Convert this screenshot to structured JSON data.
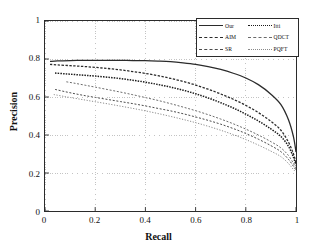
{
  "chart_data": {
    "type": "line",
    "title": "",
    "xlabel": "Recall",
    "ylabel": "Precision",
    "xlim": [
      0,
      1
    ],
    "ylim": [
      0,
      1
    ],
    "xticks": [
      "0",
      "0.2",
      "0.4",
      "0.6",
      "0.8",
      "1"
    ],
    "xtick_values": [
      0,
      0.2,
      0.4,
      0.6,
      0.8,
      1
    ],
    "yticks": [
      "0",
      "0.2",
      "0.4",
      "0.6",
      "0.8",
      "1"
    ],
    "ytick_values": [
      0,
      0.2,
      0.4,
      0.6,
      0.8,
      1
    ],
    "grid": true,
    "grid_style": "dotted",
    "legend_position": "upper right",
    "legend_columns": 2,
    "series": [
      {
        "name": "Our",
        "style": "solid",
        "color": "#2b2b2b",
        "width": 1.3,
        "x": [
          0.02,
          0.05,
          0.1,
          0.15,
          0.2,
          0.25,
          0.3,
          0.35,
          0.4,
          0.45,
          0.5,
          0.55,
          0.6,
          0.65,
          0.7,
          0.75,
          0.8,
          0.85,
          0.9,
          0.94,
          0.97,
          0.99,
          1.0
        ],
        "y": [
          0.787,
          0.79,
          0.792,
          0.793,
          0.793,
          0.793,
          0.793,
          0.792,
          0.791,
          0.789,
          0.786,
          0.78,
          0.772,
          0.76,
          0.745,
          0.725,
          0.7,
          0.665,
          0.615,
          0.56,
          0.48,
          0.39,
          0.31
        ]
      },
      {
        "name": "AIM",
        "style": "dashed",
        "color": "#2b2b2b",
        "width": 1.3,
        "x": [
          0.02,
          0.05,
          0.1,
          0.15,
          0.2,
          0.25,
          0.3,
          0.35,
          0.4,
          0.45,
          0.5,
          0.55,
          0.6,
          0.65,
          0.7,
          0.75,
          0.8,
          0.85,
          0.9,
          0.94,
          0.97,
          0.99,
          1.0
        ],
        "y": [
          0.772,
          0.769,
          0.765,
          0.761,
          0.756,
          0.75,
          0.743,
          0.734,
          0.724,
          0.712,
          0.698,
          0.682,
          0.663,
          0.641,
          0.616,
          0.588,
          0.556,
          0.518,
          0.472,
          0.425,
          0.362,
          0.3,
          0.252
        ]
      },
      {
        "name": "Itti",
        "style": "dotted-dense",
        "color": "#1a1a1a",
        "width": 1.5,
        "x": [
          0.04,
          0.08,
          0.12,
          0.16,
          0.2,
          0.25,
          0.3,
          0.35,
          0.4,
          0.45,
          0.5,
          0.55,
          0.6,
          0.65,
          0.7,
          0.75,
          0.8,
          0.85,
          0.9,
          0.94,
          0.97,
          0.99,
          1.0
        ],
        "y": [
          0.726,
          0.722,
          0.718,
          0.714,
          0.71,
          0.704,
          0.697,
          0.688,
          0.678,
          0.666,
          0.652,
          0.636,
          0.617,
          0.595,
          0.57,
          0.542,
          0.51,
          0.474,
          0.432,
          0.392,
          0.34,
          0.282,
          0.24
        ]
      },
      {
        "name": "QDCT",
        "style": "dashed-fine",
        "color": "#6a6a6a",
        "width": 1.0,
        "x": [
          0.085,
          0.12,
          0.16,
          0.2,
          0.25,
          0.3,
          0.35,
          0.4,
          0.45,
          0.5,
          0.55,
          0.6,
          0.65,
          0.7,
          0.75,
          0.8,
          0.85,
          0.9,
          0.94,
          0.97,
          0.99,
          1.0
        ],
        "y": [
          0.68,
          0.672,
          0.662,
          0.652,
          0.639,
          0.626,
          0.612,
          0.597,
          0.582,
          0.565,
          0.547,
          0.528,
          0.507,
          0.484,
          0.459,
          0.431,
          0.4,
          0.365,
          0.332,
          0.292,
          0.25,
          0.222
        ]
      },
      {
        "name": "SR",
        "style": "dashed-fine",
        "color": "#4a4a4a",
        "width": 1.0,
        "x": [
          0.04,
          0.08,
          0.12,
          0.16,
          0.2,
          0.25,
          0.3,
          0.35,
          0.4,
          0.45,
          0.5,
          0.55,
          0.6,
          0.65,
          0.7,
          0.75,
          0.8,
          0.85,
          0.9,
          0.94,
          0.97,
          0.99,
          1.0
        ],
        "y": [
          0.64,
          0.628,
          0.617,
          0.607,
          0.598,
          0.587,
          0.576,
          0.565,
          0.553,
          0.54,
          0.527,
          0.512,
          0.495,
          0.477,
          0.457,
          0.434,
          0.408,
          0.378,
          0.344,
          0.312,
          0.272,
          0.235,
          0.215
        ]
      },
      {
        "name": "PQFT",
        "style": "dotted-fine",
        "color": "#8a8a8a",
        "width": 1.0,
        "x": [
          0.035,
          0.08,
          0.12,
          0.16,
          0.2,
          0.25,
          0.3,
          0.35,
          0.4,
          0.45,
          0.5,
          0.55,
          0.6,
          0.65,
          0.7,
          0.75,
          0.8,
          0.85,
          0.9,
          0.94,
          0.97,
          0.99,
          1.0
        ],
        "y": [
          0.613,
          0.602,
          0.593,
          0.584,
          0.575,
          0.564,
          0.552,
          0.54,
          0.527,
          0.513,
          0.498,
          0.482,
          0.465,
          0.446,
          0.425,
          0.402,
          0.376,
          0.347,
          0.315,
          0.286,
          0.25,
          0.218,
          0.205
        ]
      }
    ]
  },
  "legend": {
    "entries": [
      {
        "label": "Our",
        "series_index": 0
      },
      {
        "label": "Itti",
        "series_index": 2
      },
      {
        "label": "AIM",
        "series_index": 1
      },
      {
        "label": "QDCT",
        "series_index": 3
      },
      {
        "label": "SR",
        "series_index": 4
      },
      {
        "label": "PQFT",
        "series_index": 5
      }
    ]
  }
}
